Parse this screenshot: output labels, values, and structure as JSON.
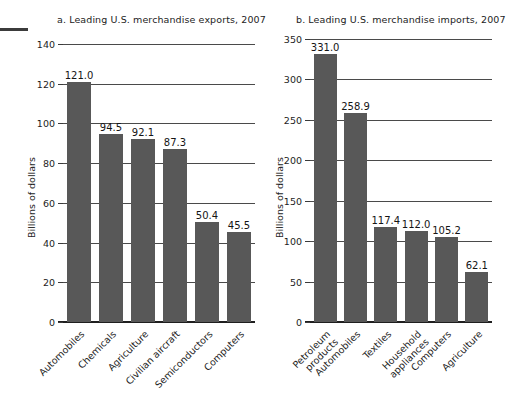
{
  "figure": {
    "background": "#ffffff",
    "bar_color": "#585858",
    "artifact": "page-edge-dash"
  },
  "chart_data": [
    {
      "type": "bar",
      "panel": "a",
      "title": "a. Leading U.S. merchandise exports, 2007",
      "xlabel": "",
      "ylabel": "Billions of dollars",
      "ylim": [
        0,
        140
      ],
      "yticks": [
        0,
        20,
        40,
        60,
        80,
        100,
        120,
        140
      ],
      "grid": true,
      "legend": "none",
      "categories": [
        "Automobiles",
        "Chemicals",
        "Agriculture",
        "Civilian aircraft",
        "Semiconductors",
        "Computers"
      ],
      "values": [
        121.0,
        94.5,
        92.1,
        87.3,
        50.4,
        45.5
      ],
      "value_labels": [
        "121.0",
        "94.5",
        "92.1",
        "87.3",
        "50.4",
        "45.5"
      ]
    },
    {
      "type": "bar",
      "panel": "b",
      "title": "b. Leading U.S. merchandise imports, 2007",
      "xlabel": "",
      "ylabel": "Billions of dollars",
      "ylim": [
        0,
        350
      ],
      "yticks": [
        0,
        50,
        100,
        150,
        200,
        250,
        300,
        350
      ],
      "grid": true,
      "legend": "none",
      "categories": [
        "Petroleum products",
        "Automobiles",
        "Textiles",
        "Household appliances",
        "Computers",
        "Agriculture"
      ],
      "category_lines": [
        [
          "Petroleum",
          "products"
        ],
        [
          "Automobiles"
        ],
        [
          "Textiles"
        ],
        [
          "Household",
          "appliances"
        ],
        [
          "Computers"
        ],
        [
          "Agriculture"
        ]
      ],
      "values": [
        331.0,
        258.9,
        117.4,
        112.0,
        105.2,
        62.1
      ],
      "value_labels": [
        "331.0",
        "258.9",
        "117.4",
        "112.0",
        "105.2",
        "62.1"
      ]
    }
  ]
}
